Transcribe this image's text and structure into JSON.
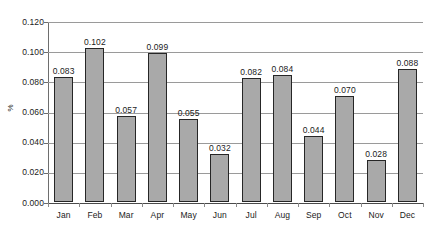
{
  "chart_data": {
    "type": "bar",
    "title": "",
    "subtitle": "",
    "xlabel": "",
    "ylabel": "%",
    "categories": [
      "Jan",
      "Feb",
      "Mar",
      "Apr",
      "May",
      "Jun",
      "Jul",
      "Aug",
      "Sep",
      "Oct",
      "Nov",
      "Dec"
    ],
    "values": [
      0.083,
      0.102,
      0.057,
      0.099,
      0.055,
      0.032,
      0.082,
      0.084,
      0.044,
      0.07,
      0.028,
      0.088
    ],
    "value_labels": [
      "0.083",
      "0.102",
      "0.057",
      "0.099",
      "0.055",
      "0.032",
      "0.082",
      "0.084",
      "0.044",
      "0.070",
      "0.028",
      "0.088"
    ],
    "ylim": [
      0.0,
      0.12
    ],
    "y_ticks": [
      0.0,
      0.02,
      0.04,
      0.06,
      0.08,
      0.1,
      0.12
    ],
    "y_tick_labels": [
      "0.000",
      "0.020",
      "0.040",
      "0.060",
      "0.080",
      "0.100",
      "0.120"
    ],
    "grid": true,
    "grid_axis": "y",
    "legend": false,
    "legend_position": "none",
    "data_labels": true,
    "series": [
      {
        "name": "%",
        "values": [
          0.083,
          0.102,
          0.057,
          0.099,
          0.055,
          0.032,
          0.082,
          0.084,
          0.044,
          0.07,
          0.028,
          0.088
        ]
      }
    ],
    "colors": {
      "bar_fill": "#a9a9a9",
      "bar_border": "#262626",
      "gridline": "#9a9a9a",
      "axis": "#6e6e6e",
      "text": "#1b1b1b",
      "background": "#ffffff"
    }
  }
}
